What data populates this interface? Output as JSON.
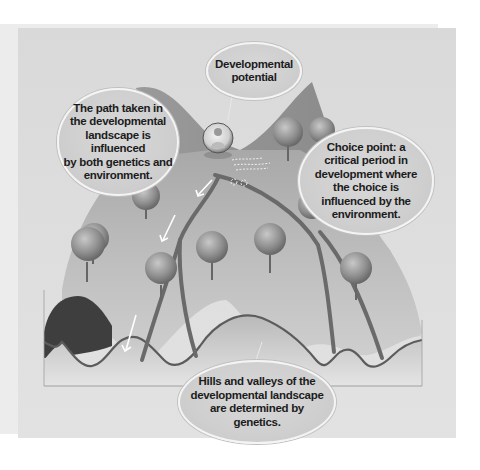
{
  "figure": {
    "title": "Developmental landscape",
    "colors": {
      "background": "#ffffff",
      "panel": "#dcdcdc",
      "landscape_light": "#c4c4c4",
      "landscape_dark": "#7a7a7a",
      "path": "#6a6a6a",
      "bubble_fill": "#d2d2d2",
      "bubble_border": "#f4f4f4",
      "text": "#1c1c1c",
      "arrow": "#ffffff"
    }
  },
  "callouts": {
    "potential": "Developmental\npotential",
    "path": "The path taken in\nthe developmental\nlandscape is influenced\nby both genetics and\nenvironment.",
    "choice": "Choice point: a\ncritical period in\ndevelopment where\nthe choice is\ninfluenced by the\nenvironment.",
    "hills": "Hills and valleys of  the\ndevelopmental landscape\nare determined by\ngenetics."
  },
  "elements": {
    "child_icon": "child-in-bubble",
    "trees": 10,
    "arrows": 3
  }
}
